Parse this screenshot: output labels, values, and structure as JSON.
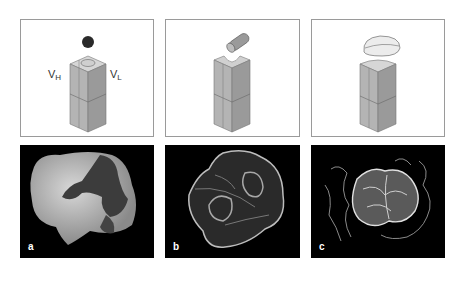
{
  "figure": {
    "top_row": [
      {
        "id": "panel-1",
        "labels": {
          "vh_main": "V",
          "vh_sub": "H",
          "vl_main": "V",
          "vl_sub": "L"
        },
        "ligand": "sphere"
      },
      {
        "id": "panel-2",
        "ligand": "cylinder"
      },
      {
        "id": "panel-3",
        "ligand": "disc"
      }
    ],
    "bottom_row": [
      {
        "id": "a",
        "label": "a",
        "style": "space-filling"
      },
      {
        "id": "b",
        "label": "b",
        "style": "surface-mesh"
      },
      {
        "id": "c",
        "label": "c",
        "style": "wire-trace"
      }
    ]
  }
}
